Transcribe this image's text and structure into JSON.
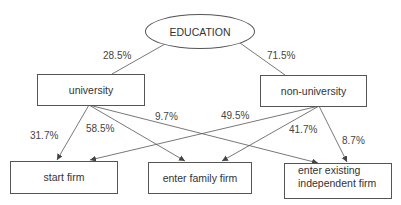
{
  "diagram": {
    "root": {
      "label": "EDUCATION"
    },
    "level1": [
      {
        "id": "university",
        "label": "university",
        "share": "28.5%"
      },
      {
        "id": "non_university",
        "label": "non-university",
        "share": "71.5%"
      }
    ],
    "outcomes": [
      {
        "id": "start_firm",
        "label": "start firm"
      },
      {
        "id": "family_firm",
        "label": "enter family firm"
      },
      {
        "id": "existing_firm",
        "label_line1": "enter existing",
        "label_line2": "independent firm"
      }
    ],
    "edges": {
      "university_to_start": "31.7%",
      "university_to_family": "58.5%",
      "university_to_existing": "9.7%",
      "non_university_to_start": "49.5%",
      "non_university_to_family": "41.7%",
      "non_university_to_existing": "8.7%"
    },
    "colors": {
      "line": "#555555",
      "text": "#333333",
      "background": "#ffffff"
    }
  }
}
